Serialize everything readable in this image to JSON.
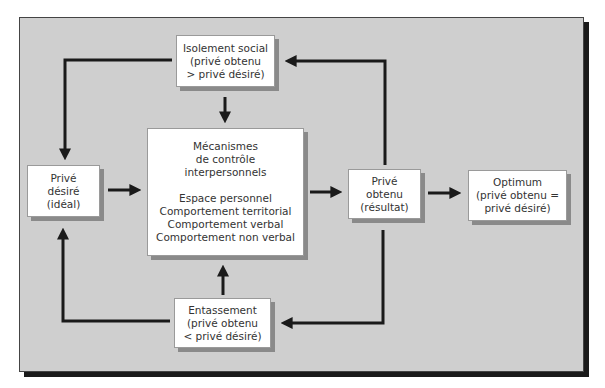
{
  "diagram": {
    "nodes": {
      "isolement": {
        "lines": [
          "Isolement social",
          "(privé obtenu",
          "> privé désiré)"
        ]
      },
      "mecanismes": {
        "title_lines": [
          "Mécanismes",
          "de contrôle",
          "interpersonnels"
        ],
        "items": [
          "Espace personnel",
          "Comportement territorial",
          "Comportement verbal",
          "Comportement non verbal"
        ]
      },
      "prive_desire": {
        "lines": [
          "Privé",
          "désiré",
          "(idéal)"
        ]
      },
      "prive_obtenu": {
        "lines": [
          "Privé",
          "obtenu",
          "(résultat)"
        ]
      },
      "optimum": {
        "lines": [
          "Optimum",
          "(privé obtenu =",
          "privé désiré)"
        ]
      },
      "entassement": {
        "lines": [
          "Entassement",
          "(privé obtenu",
          "< privé désiré)"
        ]
      }
    },
    "edges": [
      {
        "from": "prive_desire",
        "to": "mecanismes"
      },
      {
        "from": "mecanismes",
        "to": "prive_obtenu"
      },
      {
        "from": "prive_obtenu",
        "to": "optimum"
      },
      {
        "from": "prive_obtenu",
        "to": "isolement"
      },
      {
        "from": "prive_obtenu",
        "to": "entassement"
      },
      {
        "from": "isolement",
        "to": "mecanismes"
      },
      {
        "from": "isolement",
        "to": "prive_desire"
      },
      {
        "from": "entassement",
        "to": "mecanismes"
      },
      {
        "from": "entassement",
        "to": "prive_desire"
      }
    ],
    "colors": {
      "background": "#cfcfcf",
      "box": "#ffffff",
      "arrow": "#1a1a1a",
      "text": "#333333"
    }
  }
}
